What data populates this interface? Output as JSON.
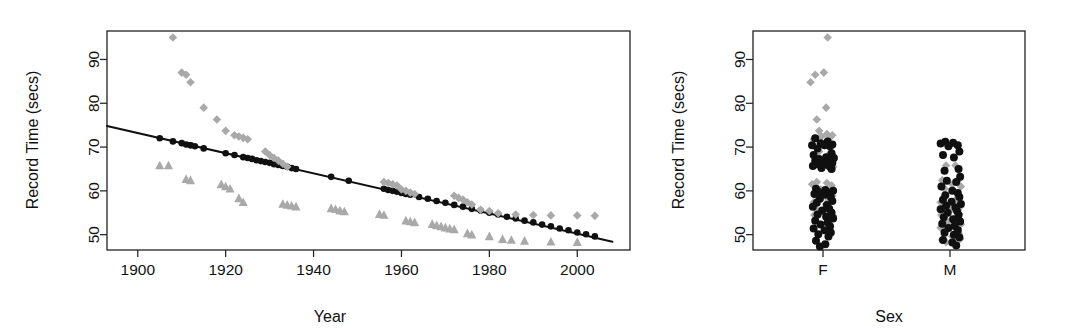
{
  "figure": {
    "background": "#ffffff",
    "ink_color": "#121212",
    "gray_marker_color": "#a9a9a9",
    "black_marker_color": "#101010"
  },
  "chart_data": [
    {
      "id": "left-panel",
      "type": "scatter",
      "title": "",
      "xlabel": "Year",
      "ylabel": "Record Time (secs)",
      "xlim": [
        1893,
        2012
      ],
      "ylim": [
        46.5,
        96.5
      ],
      "xticks": [
        1900,
        1920,
        1940,
        1960,
        1980,
        2000
      ],
      "xticklabels": [
        "1900",
        "1920",
        "1940",
        "1960",
        "1980",
        "2000"
      ],
      "yticks": [
        50,
        60,
        70,
        80,
        90
      ],
      "yticklabels": [
        "50",
        "60",
        "70",
        "80",
        "90"
      ],
      "grid": false,
      "legend": "none",
      "series": [
        {
          "name": "fitted-line",
          "marker": "line",
          "color": "#101010",
          "points": [
            [
              1893,
              74.8
            ],
            [
              2008,
              48.4
            ]
          ]
        },
        {
          "name": "fitted-values",
          "marker": "filled-circle",
          "color": "#101010",
          "x": [
            1905,
            1908,
            1910,
            1911,
            1912,
            1912,
            1913,
            1915,
            1920,
            1922,
            1924,
            1925,
            1926,
            1927,
            1928,
            1929,
            1930,
            1931,
            1932,
            1933,
            1934,
            1935,
            1936,
            1944,
            1948,
            1956,
            1957,
            1958,
            1959,
            1960,
            1961,
            1962,
            1964,
            1966,
            1968,
            1970,
            1972,
            1974,
            1976,
            1978,
            1980,
            1982,
            1984,
            1986,
            1988,
            1990,
            1992,
            1994,
            1996,
            1998,
            2000,
            2002,
            2004
          ],
          "y": [
            72.0,
            71.3,
            70.9,
            70.6,
            70.4,
            70.4,
            70.2,
            69.7,
            68.6,
            68.2,
            67.7,
            67.5,
            67.3,
            67.0,
            66.8,
            66.6,
            66.4,
            66.1,
            65.9,
            65.7,
            65.5,
            65.2,
            65.0,
            63.2,
            62.3,
            60.5,
            60.2,
            60.0,
            59.8,
            59.5,
            59.3,
            59.1,
            58.6,
            58.2,
            57.7,
            57.3,
            56.8,
            56.4,
            55.9,
            55.5,
            55.0,
            54.6,
            54.1,
            53.7,
            53.2,
            52.8,
            52.3,
            51.9,
            51.4,
            51.0,
            50.5,
            50.1,
            49.6
          ]
        },
        {
          "name": "female-records",
          "marker": "diamond",
          "color": "#a9a9a9",
          "x": [
            1908,
            1910,
            1911,
            1912,
            1915,
            1918,
            1920,
            1922,
            1923,
            1924,
            1925,
            1929,
            1930,
            1931,
            1932,
            1933,
            1934,
            1956,
            1957,
            1958,
            1959,
            1960,
            1961,
            1962,
            1963,
            1972,
            1973,
            1974,
            1975,
            1976,
            1978,
            1980,
            1982,
            1986,
            1990,
            1994,
            2000,
            2004
          ],
          "y": [
            95.0,
            87.0,
            86.5,
            84.8,
            79.0,
            76.3,
            73.7,
            72.7,
            72.4,
            72.1,
            71.8,
            69.0,
            68.2,
            67.5,
            66.9,
            66.2,
            65.5,
            62.0,
            61.8,
            61.5,
            61.2,
            60.3,
            60.0,
            59.6,
            59.3,
            58.9,
            58.4,
            58.0,
            57.4,
            56.9,
            55.7,
            55.4,
            54.9,
            54.6,
            54.5,
            54.4,
            54.4,
            54.3
          ]
        },
        {
          "name": "male-records",
          "marker": "triangle",
          "color": "#a9a9a9",
          "x": [
            1905,
            1907,
            1911,
            1912,
            1919,
            1920,
            1921,
            1923,
            1924,
            1933,
            1934,
            1935,
            1936,
            1944,
            1945,
            1946,
            1947,
            1955,
            1956,
            1961,
            1962,
            1963,
            1967,
            1968,
            1969,
            1970,
            1971,
            1972,
            1975,
            1976,
            1980,
            1983,
            1985,
            1988,
            1994,
            2000
          ],
          "y": [
            65.8,
            65.8,
            62.7,
            62.4,
            61.5,
            61.0,
            60.5,
            58.3,
            57.4,
            57.0,
            56.8,
            56.6,
            56.4,
            56.0,
            55.8,
            55.5,
            55.3,
            54.7,
            54.5,
            53.2,
            53.0,
            52.8,
            52.4,
            52.1,
            51.9,
            51.6,
            51.4,
            51.2,
            50.3,
            50.0,
            49.6,
            49.0,
            48.8,
            48.6,
            48.4,
            48.3
          ]
        }
      ]
    },
    {
      "id": "right-panel",
      "type": "scatter",
      "title": "",
      "xlabel": "Sex",
      "ylabel": "Record Time (secs)",
      "categories": [
        "F",
        "M"
      ],
      "xticks": [
        1,
        2
      ],
      "xticklabels": [
        "F",
        "M"
      ],
      "ylim": [
        46.5,
        96.5
      ],
      "yticks": [
        50,
        60,
        70,
        80,
        90
      ],
      "yticklabels": [
        "50",
        "60",
        "70",
        "80",
        "90"
      ],
      "grid": false,
      "legend": "none",
      "series": [
        {
          "name": "F-observed",
          "marker": "diamond",
          "color": "#a9a9a9",
          "values": [
            95.0,
            87.0,
            86.5,
            84.8,
            79.0,
            76.3,
            73.7,
            73.0,
            72.7,
            72.4,
            72.1,
            71.8,
            69.0,
            68.2,
            67.5,
            66.9,
            66.2,
            65.5,
            62.0,
            61.8,
            61.5,
            61.2,
            60.3,
            60.0,
            59.6,
            59.3,
            58.9,
            58.4,
            58.0,
            57.4,
            56.9,
            55.7,
            55.4,
            54.9,
            54.6,
            54.5,
            54.4,
            54.3
          ],
          "jitter": [
            0.06,
            0.01,
            -0.1,
            -0.16,
            0.04,
            -0.08,
            -0.05,
            0.05,
            0.12,
            -0.02,
            0.08,
            -0.12,
            -0.05,
            0.07,
            -0.1,
            0.1,
            0.03,
            0.13,
            -0.08,
            0.05,
            -0.14,
            0.11,
            -0.03,
            0.09,
            -0.11,
            0.02,
            0.12,
            -0.06,
            0.07,
            -0.12,
            0.04,
            -0.08,
            0.1,
            -0.04,
            0.09,
            -0.11,
            0.05,
            0.13
          ]
        },
        {
          "name": "F-fitted",
          "marker": "filled-circle",
          "color": "#101010",
          "values": [
            72.0,
            71.3,
            70.9,
            70.6,
            70.4,
            70.4,
            70.2,
            69.7,
            68.6,
            68.2,
            67.7,
            67.5,
            67.3,
            67.0,
            66.8,
            66.6,
            66.4,
            66.1,
            65.9,
            65.7,
            65.5,
            65.2,
            65.0,
            60.5,
            60.2,
            60.0,
            59.8,
            59.5,
            59.3,
            59.1,
            58.6,
            58.2,
            57.7,
            57.3,
            56.8,
            56.4,
            55.9,
            55.5,
            55.0,
            54.6,
            54.1,
            53.7,
            53.2,
            52.8,
            52.3,
            51.9,
            51.4,
            51.0,
            50.5,
            50.1,
            49.6,
            48.6,
            47.8,
            47.3
          ],
          "jitter": [
            -0.1,
            0.06,
            -0.03,
            0.12,
            -0.14,
            0.02,
            0.09,
            -0.07,
            0.11,
            -0.12,
            0.04,
            0.14,
            -0.05,
            0.08,
            -0.1,
            0.01,
            0.12,
            -0.08,
            0.06,
            -0.13,
            0.09,
            -0.02,
            0.11,
            -0.09,
            0.03,
            0.13,
            -0.06,
            0.07,
            -0.11,
            0.02,
            0.1,
            -0.04,
            0.12,
            -0.08,
            0.05,
            -0.13,
            0.08,
            -0.01,
            0.11,
            -0.07,
            0.04,
            0.13,
            -0.1,
            0.06,
            -0.03,
            0.09,
            -0.12,
            0.02,
            0.1,
            -0.06,
            0.07,
            -0.09,
            0.03,
            -0.04
          ]
        },
        {
          "name": "M-observed",
          "marker": "diamond",
          "color": "#a9a9a9",
          "values": [
            65.8,
            65.8,
            62.7,
            62.4,
            61.5,
            61.0,
            60.5,
            58.3,
            57.4,
            57.0,
            56.8,
            56.6,
            56.4,
            56.0,
            55.8,
            55.5,
            55.3,
            54.7,
            54.5,
            53.2,
            53.0,
            52.8,
            52.4,
            52.1,
            51.9,
            51.6,
            51.4,
            51.2,
            50.3,
            50.0,
            49.6,
            49.0,
            48.8,
            48.6,
            48.4,
            48.3
          ],
          "jitter": [
            0.07,
            -0.05,
            0.12,
            -0.1,
            0.03,
            0.14,
            -0.07,
            0.09,
            -0.12,
            0.05,
            0.11,
            -0.03,
            0.13,
            -0.09,
            0.02,
            0.1,
            -0.06,
            0.12,
            -0.11,
            0.04,
            0.08,
            -0.02,
            0.14,
            -0.08,
            0.06,
            -0.12,
            0.1,
            -0.04,
            0.11,
            -0.07,
            0.03,
            0.13,
            -0.1,
            0.05,
            0.09,
            -0.05
          ]
        },
        {
          "name": "M-fitted",
          "marker": "filled-circle",
          "color": "#101010",
          "values": [
            71.2,
            71.0,
            70.8,
            70.4,
            70.2,
            69.0,
            68.2,
            67.6,
            65.0,
            64.6,
            63.2,
            62.3,
            62.0,
            61.0,
            60.0,
            59.5,
            59.0,
            58.6,
            58.0,
            57.5,
            57.0,
            56.6,
            56.2,
            55.8,
            55.4,
            55.0,
            54.5,
            54.0,
            53.5,
            53.0,
            52.5,
            52.0,
            51.5,
            51.0,
            50.5,
            50.0,
            49.4,
            48.8,
            48.2,
            47.5
          ],
          "jitter": [
            -0.06,
            0.04,
            -0.12,
            0.1,
            -0.02,
            0.12,
            -0.09,
            0.05,
            0.11,
            -0.07,
            0.13,
            -0.04,
            0.08,
            -0.11,
            0.03,
            0.1,
            -0.06,
            0.12,
            -0.09,
            0.02,
            0.14,
            -0.05,
            0.07,
            -0.12,
            0.09,
            -0.03,
            0.11,
            -0.08,
            0.04,
            0.13,
            -0.1,
            0.06,
            -0.02,
            0.1,
            -0.07,
            0.05,
            0.12,
            -0.09,
            0.03,
            0.08
          ]
        }
      ]
    }
  ],
  "left_panel": {
    "ylabel": "Record Time (secs)",
    "xlabel": "Year",
    "xticklabels": [
      "1900",
      "1920",
      "1940",
      "1960",
      "1980",
      "2000"
    ],
    "yticklabels": [
      "50",
      "60",
      "70",
      "80",
      "90"
    ]
  },
  "right_panel": {
    "ylabel": "Record Time (secs)",
    "xlabel": "Sex",
    "xticklabels": [
      "F",
      "M"
    ],
    "yticklabels": [
      "50",
      "60",
      "70",
      "80",
      "90"
    ]
  }
}
